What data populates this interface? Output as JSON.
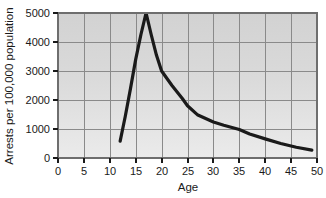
{
  "chart_data": {
    "type": "line",
    "title": "",
    "subtitle": "",
    "xlabel": "Age",
    "ylabel": "Arrests per 100,000 population",
    "xlim": [
      0,
      50
    ],
    "ylim": [
      0,
      5000
    ],
    "xticks": [
      "0",
      "5",
      "10",
      "15",
      "20",
      "25",
      "30",
      "35",
      "40",
      "45",
      "50"
    ],
    "yticks": [
      "0",
      "1000",
      "2000",
      "3000",
      "4000",
      "5000"
    ],
    "grid": true,
    "legend": "none",
    "plot_background": "#d9d9d9",
    "line_color": "#1a1a1a",
    "grid_color": "#808080",
    "series": [
      {
        "name": "Arrest rate by age",
        "x": [
          12,
          13,
          14,
          15,
          16,
          17,
          18,
          19,
          20,
          22,
          24,
          25,
          27,
          30,
          32,
          35,
          37,
          40,
          43,
          46,
          49
        ],
        "values": [
          580,
          1450,
          2400,
          3400,
          4250,
          5000,
          4250,
          3550,
          3000,
          2500,
          2050,
          1800,
          1480,
          1240,
          1130,
          980,
          830,
          660,
          500,
          370,
          270
        ]
      }
    ]
  },
  "axes": {
    "x_title": "Age",
    "y_title": "Arrests per 100,000 population"
  }
}
